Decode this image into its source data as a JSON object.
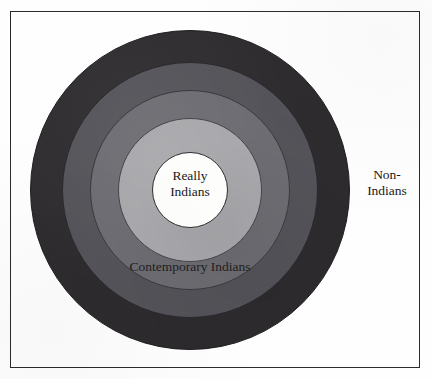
{
  "figure": {
    "kind": "concentric-circle-diagram",
    "background_color": "#fefefe",
    "frame": {
      "visible": true,
      "border_color": "#2b2a2c"
    },
    "center": {
      "x": 190,
      "y": 190
    },
    "rings": [
      {
        "id": "non-indians",
        "label": "Non-\nIndians",
        "label_position": "outside-right",
        "radius": 160,
        "color": "#2e2c2e",
        "order": 1
      },
      {
        "id": "band-3",
        "label": "",
        "label_position": "none",
        "radius": 128,
        "color": "#55545a",
        "order": 2
      },
      {
        "id": "band-2",
        "label": "Contemporary Indians",
        "label_position": "lower-band",
        "radius": 100,
        "color": "#6e6d73",
        "order": 3
      },
      {
        "id": "band-1",
        "label": "",
        "label_position": "none",
        "radius": 72,
        "color": "#a9a8ac",
        "order": 4
      },
      {
        "id": "really-indians",
        "label": "Really\nIndians",
        "label_position": "center",
        "radius": 38,
        "color": "#fdfdfc",
        "order": 5
      }
    ]
  },
  "labels": {
    "center": "Really\nIndians",
    "middle": "Contemporary Indians",
    "outer": "Non-\nIndians"
  },
  "chart_data": {
    "type": "pie",
    "title": "",
    "xlabel": "",
    "ylabel": "",
    "legend_position": "none",
    "grid": false,
    "categories": [
      "Really Indians",
      "Contemporary Indians",
      "Non-Indians"
    ],
    "rings_outer_to_inner": [
      {
        "name": "Non-Indians",
        "radius": 160,
        "color": "#2e2c2e"
      },
      {
        "name": "",
        "radius": 128,
        "color": "#55545a"
      },
      {
        "name": "Contemporary Indians",
        "radius": 100,
        "color": "#6e6d73"
      },
      {
        "name": "",
        "radius": 72,
        "color": "#a9a8ac"
      },
      {
        "name": "Really Indians",
        "radius": 38,
        "color": "#fdfdfc"
      }
    ],
    "values": [
      38,
      100,
      160
    ],
    "annotations": [
      "Really Indians",
      "Contemporary Indians",
      "Non-Indians"
    ]
  }
}
